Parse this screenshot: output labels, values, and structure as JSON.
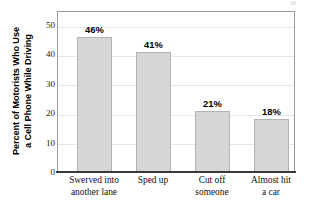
{
  "chart_data": {
    "type": "bar",
    "title": "",
    "xlabel": "",
    "ylabel": "Percent of Motorists Who Use a Cell Phone While Driving",
    "ylabel_lines": [
      "Percent of Motorists Who Use",
      "a Cell Phone While Driving"
    ],
    "categories": [
      "Swerved into another lane",
      "Sped up",
      "Cut off someone",
      "Almost hit a car"
    ],
    "category_lines": [
      [
        "Swerved into",
        "another lane"
      ],
      [
        "Sped up",
        ""
      ],
      [
        "Cut off",
        "someone"
      ],
      [
        "Almost hit",
        "a car"
      ]
    ],
    "values": [
      46,
      41,
      21,
      18
    ],
    "value_labels": [
      "46%",
      "41%",
      "21%",
      "18%"
    ],
    "ylim": [
      0,
      55
    ],
    "yticks": [
      0,
      10,
      20,
      30,
      40,
      50
    ],
    "ytick_labels": [
      "0",
      "10",
      "20",
      "30",
      "40",
      "50"
    ],
    "grid": true,
    "grid_axis": "y",
    "legend": false,
    "colors": {
      "bar_fill": "#d6d6d6",
      "bar_border": "#b3b3b3",
      "gridline": "#e6e6e6",
      "frame": "#9a9a9a",
      "axis": "#3a3a3a",
      "text": "#111111",
      "background": "#ffffff"
    }
  }
}
